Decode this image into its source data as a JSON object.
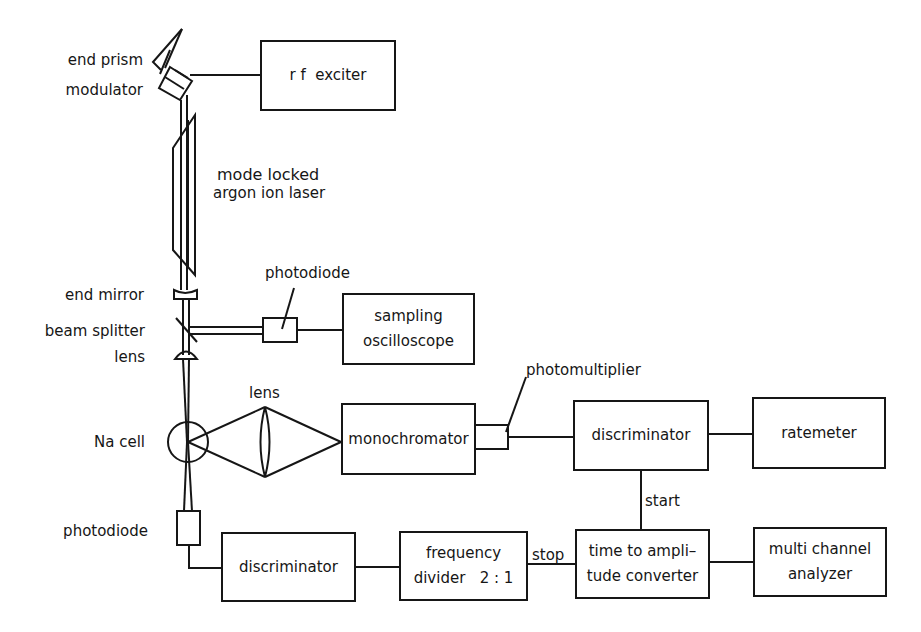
{
  "diagram": {
    "type": "block-diagram",
    "title": "",
    "colors": {
      "ink": "#161616",
      "background": "#ffffff"
    },
    "components": {
      "rf_exciter": {
        "lines": [
          "r f  exciter"
        ]
      },
      "sampling_oscilloscope": {
        "lines": [
          "sampling",
          "oscilloscope"
        ]
      },
      "monochromator": {
        "lines": [
          "monochromator"
        ]
      },
      "discriminator_top": {
        "lines": [
          "discriminator"
        ]
      },
      "ratemeter": {
        "lines": [
          "ratemeter"
        ]
      },
      "discriminator_bottom": {
        "lines": [
          "discriminator"
        ]
      },
      "frequency_divider": {
        "lines": [
          "frequency",
          "divider   2 : 1"
        ]
      },
      "tac": {
        "lines": [
          "time to ampli–",
          "tude converter"
        ]
      },
      "mca": {
        "lines": [
          "multi channel",
          "analyzer"
        ]
      }
    },
    "labels": {
      "end_prism": "end prism",
      "modulator": "modulator",
      "laser_line1": "mode locked",
      "laser_line2": "argon ion laser",
      "end_mirror": "end mirror",
      "beam_splitter": "beam splitter",
      "lens_left": "lens",
      "photodiode_top": "photodiode",
      "lens_center": "lens",
      "na_cell": "Na cell",
      "photomultiplier": "photomultiplier",
      "start": "start",
      "stop": "stop",
      "photodiode_bottom": "photodiode"
    },
    "connections": [
      {
        "from": "modulator",
        "to": "rf_exciter"
      },
      {
        "from": "beam_splitter",
        "to": "photodiode_top"
      },
      {
        "from": "photodiode_top",
        "to": "sampling_oscilloscope"
      },
      {
        "from": "na_cell",
        "to": "lens_center"
      },
      {
        "from": "lens_center",
        "to": "monochromator"
      },
      {
        "from": "monochromator",
        "to": "photomultiplier"
      },
      {
        "from": "photomultiplier",
        "to": "discriminator_top"
      },
      {
        "from": "discriminator_top",
        "to": "ratemeter"
      },
      {
        "from": "discriminator_top",
        "to": "tac",
        "label": "start"
      },
      {
        "from": "photodiode_bottom",
        "to": "discriminator_bottom"
      },
      {
        "from": "discriminator_bottom",
        "to": "frequency_divider"
      },
      {
        "from": "frequency_divider",
        "to": "tac",
        "label": "stop"
      },
      {
        "from": "tac",
        "to": "mca"
      }
    ]
  }
}
